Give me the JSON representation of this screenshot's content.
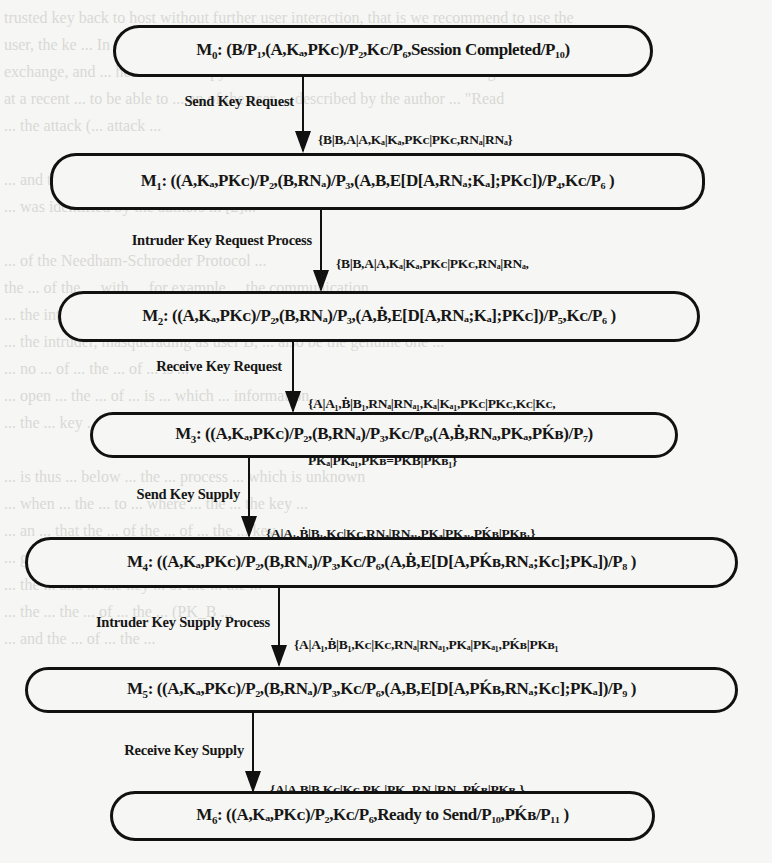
{
  "background_text": [
    "trusted key back to host without further user interaction, that is we recommend to use the",
    "user, the ke ... In this case, the user must ... the protocol, ... s set the",
    "exchange, and ... here the old copy is returned back to the user without being read.",
    "at a recent ... to be able to ... an of the user ... described by the author ... \"Read",
    "... the attack (... attack ...",
    "",
    "... and the ... ([3] ... at ... (Fig. 15) ...",
    "... was identified by the authors in [2]...",
    "",
    "... of the Needham-Schroeder Protocol ...",
    "the ... of the ... with ... for example ... the communication ...",
    "... the intruder and ... is also ... the ...",
    "... the intruder, masquerading as user B, ... also be the genuine one ...",
    "... no ... of ... the ... of ... is ...",
    "... open ... the ... of ... is ... which ... information ...",
    "... the ... key ... intruder ... the ... with ... user ...",
    "",
    "... is thus ... below ... the ... process ... which is unknown",
    "... when ... the ... to ... where ... the ... the key ...",
    "... an ... that the ... of the ... of ... the ... key ...",
    "... given ... place ... state ... the ... of ... where ...",
    "... the ... and ... the key ... of the ... the ...",
    "... the ... the ... of ... the ... (PK_B ...",
    "... and the ... of ... the ..."
  ],
  "states": [
    {
      "id": "M0",
      "label": "M",
      "sub": "0",
      "content": ": (B/P₁,(A,Kₐ,PKᴄ)/P₂,Kᴄ/P₆,Session Completed/P₁₀)"
    },
    {
      "id": "M1",
      "label": "M",
      "sub": "1",
      "content": ": ((A,Kₐ,PKᴄ)/P₂,(B,RNₐ)/P₃,(A,B,E[D[A,RNₐ;Kₐ];PKᴄ])/P₄,Kᴄ/P₆ )"
    },
    {
      "id": "M2",
      "label": "M",
      "sub": "2",
      "content": ": ((A,Kₐ,PKᴄ)/P₂,(B,RNₐ)/P₃,(A,Ḃ,E[D[A,RNₐ;Kₐ];PKᴄ])/P₅,Kᴄ/P₆ )"
    },
    {
      "id": "M3",
      "label": "M",
      "sub": "3",
      "content": ": ((A,Kₐ,PKᴄ)/P₂,(B,RNₐ)/P₃,Kᴄ/P₆,(A,Ḃ,RNₐ,PKₐ,PḰʙ)/P₇)"
    },
    {
      "id": "M4",
      "label": "M",
      "sub": "4",
      "content": ": ((A,Kₐ,PKᴄ)/P₂,(B,RNₐ)/P₃,Kᴄ/P₆,(A,Ḃ,E[D[A,PḰʙ,RNₐ;Kᴄ];PKₐ])/P₈ )"
    },
    {
      "id": "M5",
      "label": "M",
      "sub": "5",
      "content": ": ((A,Kₐ,PKᴄ)/P₂,(B,RNₐ)/P₃,Kᴄ/P₆,(A,B,E[D[A,PḰʙ,RNₐ;Kᴄ];PKₐ])/P₉ )"
    },
    {
      "id": "M6",
      "label": "M",
      "sub": "6",
      "content": ": ((A,Kₐ,PKᴄ)/P₂,Kᴄ/P₆,Ready to Send/P₁₀,PḰʙ/P₁₁ )"
    }
  ],
  "transitions": [
    {
      "name": "Send Key Request",
      "from": "M0",
      "to": "M1",
      "bindings": [
        "{B|B,A|A,Kₐ|Kₐ,PKᴄ|PKᴄ,RNₐ|RNₐ}"
      ]
    },
    {
      "name": "Intruder Key Request Process",
      "from": "M1",
      "to": "M2",
      "bindings": [
        "{B|B,A|A,Kₐ|Kₐ,PKᴄ|PKᴄ,RNₐ|RNₐ,",
        "A|A₁,Ḃ|B₁,RNₐ|RNₐ₁,Kₐ|Kₐ₁,PKᴄ|PKᴄ₁,A|A₂}"
      ]
    },
    {
      "name": "Receive Key Request",
      "from": "M2",
      "to": "M3",
      "bindings": [
        "{A|A₁,Ḃ|B₁,RNₐ|RNₐ₁,Kₐ|Kₐ₁,PKᴄ|PKᴄ,Kᴄ|Kᴄ,",
        "PKₐ|PKₐ₁,PḰʙ=PKḂ|PKʙ₁}"
      ]
    },
    {
      "name": "Send Key Supply",
      "from": "M3",
      "to": "M4",
      "bindings": [
        "{A|A₁,Ḃ|B₁,Kᴄ|Kᴄ,RNₐ|RNₐ₁,PKₐ|PKₐ₁,PḰʙ|PKʙ₁}"
      ]
    },
    {
      "name": "Intruder Key Supply Process",
      "from": "M4",
      "to": "M5",
      "bindings": [
        "{A|A₁,Ḃ|B₁,Kᴄ|Kᴄ,RNₐ|RNₐ₁,PKₐ|PKₐ₁,PḰʙ|PKʙ₁",
        "A|A₃,B|B₂,PḰʙ|PKʙ₂,RNₐ|RNₐ₂,Kᴄ|Kᴄ₁,PKₐ|PKₐ₂,A|A₄ }"
      ]
    },
    {
      "name": "Receive Key Supply",
      "from": "M5",
      "to": "M6",
      "bindings": [
        "{A|A,B|B,Kᴄ|Kᴄ,PKₐ|PKₐ,RNₐ|RNₐ,PḰʙ|PKʙ₂}"
      ]
    }
  ]
}
